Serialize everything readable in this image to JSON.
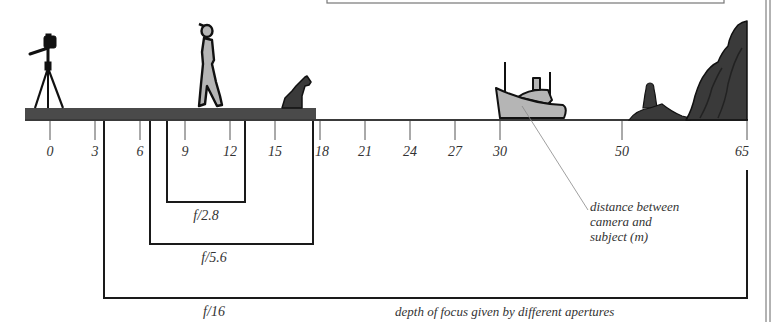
{
  "diagram": {
    "title": "depth of focus given by different apertures",
    "axis": {
      "caption": [
        "distance between",
        "camera and",
        "subject (m)"
      ],
      "ticks": [
        {
          "value": "0",
          "x": 50
        },
        {
          "value": "3",
          "x": 95
        },
        {
          "value": "6",
          "x": 140
        },
        {
          "value": "9",
          "x": 185
        },
        {
          "value": "12",
          "x": 230
        },
        {
          "value": "15",
          "x": 275
        },
        {
          "value": "18",
          "x": 320
        },
        {
          "value": "21",
          "x": 365
        },
        {
          "value": "24",
          "x": 410
        },
        {
          "value": "27",
          "x": 455
        },
        {
          "value": "30",
          "x": 500
        },
        {
          "value": "50",
          "x": 622
        },
        {
          "value": "65",
          "x": 747
        }
      ]
    },
    "apertures": [
      {
        "label": "f/2.8",
        "near_m": 10,
        "far_m": 13,
        "x1": 167,
        "x2": 245,
        "y": 202
      },
      {
        "label": "f/5.6",
        "near_m": 7,
        "far_m": 17.5,
        "x1": 150,
        "x2": 313,
        "y": 244
      },
      {
        "label": "f/16",
        "near_m": 3.5,
        "far_m": 65,
        "x1": 104,
        "x2": 747,
        "y": 298
      }
    ],
    "scene_objects": [
      {
        "name": "camera-on-tripod",
        "distance": "0"
      },
      {
        "name": "walking-person",
        "distance": "~11"
      },
      {
        "name": "sitting-dog",
        "distance": "~16"
      },
      {
        "name": "boat",
        "distance": "~30"
      },
      {
        "name": "lighthouse",
        "distance": "~55"
      },
      {
        "name": "cliffs",
        "distance": "~65"
      }
    ],
    "colors": {
      "ground": "#4a4a4a",
      "line": "#2a2a2a",
      "figure_fill": "#b5b5b5",
      "silhouette": "#3a3a3a",
      "text": "#333333"
    }
  }
}
